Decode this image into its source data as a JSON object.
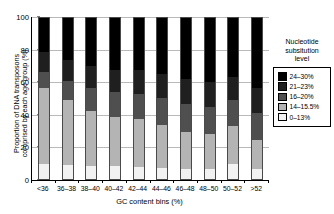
{
  "chart_data": {
    "type": "bar",
    "stacked": true,
    "title": "",
    "xlabel": "GC content bins (%)",
    "ylabel": "Proportion of DNA transposons\ncomprised by each age group (%)",
    "ylim": [
      0,
      100
    ],
    "yticks": [
      0,
      20,
      40,
      60,
      80,
      100
    ],
    "grid": true,
    "legend_position": "right",
    "legend_title": "Nucleotide\nsubsitution\nlevel",
    "categories": [
      "<36",
      "36–38",
      "38–40",
      "40–42",
      "42–44",
      "44–46",
      "46–48",
      "48–50",
      "50–52",
      ">52"
    ],
    "series": [
      {
        "name": "0–13%",
        "color": "#f2f2f2",
        "values": [
          9.5,
          8.5,
          8.0,
          8.0,
          7.5,
          7.0,
          6.5,
          6.5,
          9.0,
          6.0
        ]
      },
      {
        "name": "14–15.5%",
        "color": "#b4b4b4",
        "values": [
          47.0,
          40.5,
          34.0,
          30.5,
          29.5,
          26.5,
          22.5,
          21.5,
          24.0,
          18.5
        ]
      },
      {
        "name": "16–20%",
        "color": "#4f4f4f",
        "values": [
          10.0,
          12.0,
          14.5,
          15.5,
          16.0,
          17.0,
          17.5,
          17.0,
          16.0,
          16.5
        ]
      },
      {
        "name": "21–23%",
        "color": "#1f1f1f",
        "values": [
          12.5,
          13.0,
          13.5,
          14.0,
          14.5,
          15.0,
          15.5,
          15.5,
          14.5,
          15.5
        ]
      },
      {
        "name": "24–30%",
        "color": "#000000",
        "values": [
          21.0,
          26.0,
          30.0,
          32.0,
          32.5,
          34.5,
          38.0,
          39.5,
          36.5,
          43.5
        ]
      }
    ]
  },
  "axes": {
    "y_tick_labels": [
      "0",
      "20",
      "40",
      "60",
      "80",
      "100"
    ],
    "x_axis_title": "GC content bins (%)",
    "y_axis_title": "Proportion of DNA transposons\ncomprised by each age group (%)"
  },
  "legend": {
    "title": "Nucleotide\nsubsitution\nlevel",
    "entries": [
      {
        "label": "24–30%",
        "color": "#000000"
      },
      {
        "label": "21–23%",
        "color": "#1f1f1f"
      },
      {
        "label": "16–20%",
        "color": "#4f4f4f"
      },
      {
        "label": "14–15.5%",
        "color": "#b4b4b4"
      },
      {
        "label": "0–13%",
        "color": "#f2f2f2"
      }
    ]
  }
}
